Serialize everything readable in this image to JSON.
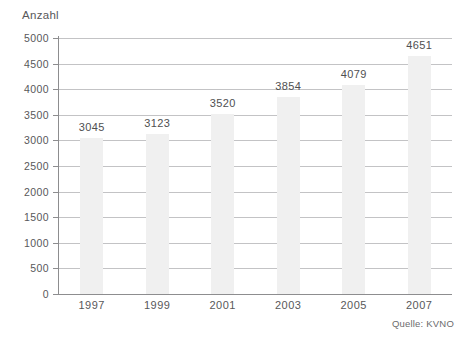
{
  "chart_data": {
    "type": "bar",
    "title": "",
    "subtitle": "",
    "xlabel": "",
    "ylabel": "Anzahl",
    "categories": [
      "1997",
      "1999",
      "2001",
      "2003",
      "2005",
      "2007"
    ],
    "values": [
      3045,
      3123,
      3520,
      3854,
      4079,
      4651
    ],
    "data_labels": [
      "3045",
      "3123",
      "3520",
      "3854",
      "4079",
      "4651"
    ],
    "ylim": [
      0,
      5000
    ],
    "ytick_step": 500,
    "ytick_labels": [
      "0",
      "500",
      "1000",
      "1500",
      "2000",
      "2500",
      "3000",
      "3500",
      "4000",
      "4500",
      "5000"
    ],
    "ytick_values": [
      0,
      500,
      1000,
      1500,
      2000,
      2500,
      3000,
      3500,
      4000,
      4500,
      5000
    ],
    "grid": true,
    "grid_axis": "y",
    "legend": false,
    "legend_position": "none",
    "series": [
      {
        "name": "Anzahl",
        "values": [
          3045,
          3123,
          3520,
          3854,
          4079,
          4651
        ]
      }
    ],
    "annotations": [
      {
        "name": "source",
        "text": "Quelle: KVNO",
        "position": "bottom-right"
      }
    ],
    "colors": {
      "bar_fill": "#f0f0f0",
      "gridline": "#b9b9bb",
      "axis_line": "#8d8d8f",
      "text": "#58585a",
      "background": "#ffffff"
    }
  }
}
